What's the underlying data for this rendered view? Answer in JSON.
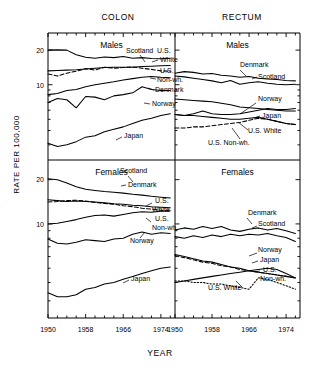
{
  "figure": {
    "column_titles": [
      "COLON",
      "RECTUM"
    ],
    "y_axis_label": "RATE PER 100,000",
    "x_axis_label": "YEAR",
    "panel_titles": [
      "Males",
      "Females"
    ]
  },
  "chart_data": {
    "type": "line",
    "xlabel": "YEAR",
    "ylabel": "RATE PER 100,000",
    "yscale": "log",
    "ylim": [
      2.6,
      24
    ],
    "xlim": [
      1950,
      1977
    ],
    "xticks": [
      1950,
      1958,
      1966,
      1974
    ],
    "xticklabels": [
      "1950",
      "1958",
      "1966",
      "1974"
    ],
    "yticks": [
      10,
      20
    ],
    "yticklabels": [
      "10",
      "20"
    ],
    "grid": false,
    "legend": "inline-annotations",
    "x": [
      1950,
      1952,
      1954,
      1956,
      1958,
      1960,
      1962,
      1964,
      1966,
      1968,
      1970,
      1972,
      1974,
      1976
    ],
    "panels": [
      {
        "panel": "COLON Males",
        "column": "COLON",
        "row": "Males",
        "series": [
          {
            "name": "Scotland",
            "style": "solid",
            "values": [
              20.0,
              20.1,
              20.0,
              18.2,
              17.3,
              17.0,
              17.4,
              17.2,
              17.6,
              17.0,
              17.2,
              16.9,
              16.8,
              17.0
            ]
          },
          {
            "name": "U.S. White",
            "style": "solid",
            "values": [
              13.2,
              13.3,
              13.4,
              13.5,
              13.7,
              13.9,
              14.1,
              14.2,
              14.2,
              14.2,
              14.4,
              14.5,
              14.6,
              14.7
            ]
          },
          {
            "name": "U.S. Non-wh.",
            "style": "dashed",
            "values": [
              12.4,
              11.9,
              12.6,
              13.1,
              13.8,
              13.4,
              14.2,
              13.9,
              14.1,
              14.3,
              13.9,
              13.6,
              13.2,
              13.1
            ]
          },
          {
            "name": "Denmark",
            "style": "solid",
            "values": [
              8.2,
              8.4,
              8.9,
              9.1,
              9.6,
              10.0,
              10.3,
              10.6,
              11.0,
              11.3,
              11.6,
              11.8,
              11.6,
              11.5
            ]
          },
          {
            "name": "Norway",
            "style": "solid",
            "values": [
              7.0,
              7.6,
              7.4,
              6.3,
              7.9,
              7.8,
              7.4,
              8.0,
              8.2,
              8.5,
              9.6,
              9.1,
              8.9,
              8.9
            ]
          },
          {
            "name": "Japan",
            "style": "solid",
            "values": [
              3.1,
              2.9,
              3.0,
              3.2,
              3.5,
              3.6,
              3.9,
              4.1,
              4.3,
              4.6,
              4.9,
              5.1,
              5.4,
              5.6
            ]
          }
        ]
      },
      {
        "panel": "COLON Females",
        "column": "COLON",
        "row": "Females",
        "series": [
          {
            "name": "Scotland",
            "style": "solid",
            "values": [
              20.3,
              20.0,
              19.0,
              17.9,
              17.2,
              16.9,
              16.6,
              16.4,
              16.2,
              15.9,
              15.7,
              15.4,
              15.2,
              15.0
            ]
          },
          {
            "name": "Denmark",
            "style": "solid",
            "values": [
              14.6,
              14.4,
              14.2,
              14.3,
              14.2,
              14.1,
              13.9,
              13.7,
              13.6,
              13.4,
              13.3,
              13.1,
              13.0,
              12.9
            ]
          },
          {
            "name": "U.S. White",
            "style": "dashed",
            "values": [
              14.1,
              14.2,
              14.4,
              14.5,
              14.3,
              14.0,
              13.8,
              13.6,
              13.3,
              13.1,
              12.8,
              12.6,
              12.4,
              12.2
            ]
          },
          {
            "name": "U.S. Non-wh.",
            "style": "solid",
            "values": [
              10.0,
              10.1,
              10.4,
              10.7,
              11.1,
              11.4,
              11.5,
              11.3,
              11.6,
              11.9,
              12.1,
              12.0,
              12.2,
              12.3
            ]
          },
          {
            "name": "Norway",
            "style": "solid",
            "values": [
              7.9,
              7.4,
              7.3,
              7.5,
              7.8,
              7.7,
              7.6,
              7.9,
              8.0,
              8.5,
              8.8,
              8.5,
              8.7,
              8.6
            ]
          },
          {
            "name": "Japan",
            "style": "solid",
            "values": [
              3.4,
              3.2,
              3.2,
              3.3,
              3.6,
              3.7,
              3.9,
              4.0,
              4.2,
              4.4,
              4.6,
              4.8,
              5.0,
              5.1
            ]
          }
        ]
      },
      {
        "panel": "RECTUM Males",
        "column": "RECTUM",
        "row": "Males",
        "series": [
          {
            "name": "Denmark",
            "style": "solid",
            "values": [
              12.6,
              13.0,
              12.8,
              12.4,
              12.5,
              12.1,
              11.9,
              11.6,
              11.8,
              11.4,
              11.2,
              11.1,
              10.9,
              10.8
            ]
          },
          {
            "name": "Scotland",
            "style": "solid",
            "values": [
              11.9,
              11.7,
              11.4,
              11.1,
              10.8,
              10.4,
              10.9,
              10.1,
              10.4,
              10.6,
              10.3,
              10.1,
              10.0,
              10.1
            ]
          },
          {
            "name": "Norway",
            "style": "solid",
            "values": [
              7.5,
              7.4,
              7.3,
              7.2,
              7.1,
              6.9,
              6.7,
              6.4,
              6.3,
              6.2,
              6.1,
              6.0,
              5.9,
              5.9
            ]
          },
          {
            "name": "Japan",
            "style": "solid",
            "values": [
              5.5,
              5.4,
              5.6,
              5.9,
              5.6,
              5.5,
              5.5,
              5.6,
              5.8,
              6.0,
              6.2,
              6.1,
              6.1,
              6.2
            ]
          },
          {
            "name": "U.S. White",
            "style": "solid",
            "values": [
              5.5,
              5.4,
              5.4,
              5.3,
              5.2,
              5.1,
              5.0,
              5.0,
              5.1,
              5.2,
              5.0,
              4.8,
              4.6,
              4.5
            ]
          },
          {
            "name": "U.S. Non-wh.",
            "style": "dashed",
            "values": [
              4.2,
              4.2,
              4.3,
              4.3,
              4.4,
              4.5,
              4.6,
              4.7,
              4.9,
              5.1,
              5.0,
              4.8,
              4.6,
              4.5
            ]
          }
        ]
      },
      {
        "panel": "RECTUM Females",
        "column": "RECTUM",
        "row": "Females",
        "series": [
          {
            "name": "Denmark",
            "style": "solid",
            "values": [
              9.1,
              9.4,
              9.2,
              9.6,
              9.3,
              9.6,
              9.1,
              8.9,
              9.2,
              9.4,
              9.1,
              9.3,
              9.0,
              8.6
            ]
          },
          {
            "name": "Scotland",
            "style": "solid",
            "values": [
              8.2,
              8.0,
              8.3,
              8.1,
              8.4,
              8.2,
              8.5,
              8.3,
              8.5,
              8.4,
              8.6,
              8.3,
              8.1,
              7.6
            ]
          },
          {
            "name": "Norway",
            "style": "solid",
            "values": [
              6.2,
              6.0,
              5.8,
              5.6,
              5.5,
              5.3,
              5.1,
              5.0,
              4.8,
              4.7,
              4.6,
              4.5,
              4.4,
              4.3
            ]
          },
          {
            "name": "Japan",
            "style": "dashed",
            "values": [
              6.1,
              5.9,
              5.7,
              5.5,
              5.4,
              5.2,
              5.1,
              4.9,
              4.8,
              4.7,
              4.6,
              4.5,
              4.4,
              4.3
            ]
          },
          {
            "name": "U.S. Non-wh.",
            "style": "solid",
            "values": [
              4.0,
              4.1,
              4.2,
              4.3,
              4.4,
              4.5,
              4.6,
              4.7,
              4.8,
              4.9,
              5.0,
              4.9,
              4.6,
              4.3
            ]
          },
          {
            "name": "U.S. White",
            "style": "dotted",
            "values": [
              4.1,
              4.1,
              4.0,
              4.0,
              3.9,
              3.9,
              3.8,
              3.7,
              3.6,
              4.3,
              4.2,
              4.0,
              3.8,
              3.6
            ]
          }
        ]
      }
    ],
    "annotations": {
      "colon_males": [
        "Scotland",
        "U.S. White",
        "U.S. Non-wh.",
        "Denmark",
        "Norway",
        "Japan"
      ],
      "colon_females": [
        "Scotland",
        "Denmark",
        "U.S. White",
        "U.S. Non-wh.",
        "Norway",
        "Japan"
      ],
      "rectum_males": [
        "Denmark",
        "Scotland",
        "Norway",
        "Japan",
        "U.S. White",
        "U.S. Non-wh."
      ],
      "rectum_females": [
        "Denmark",
        "Scotland",
        "Norway",
        "Japan",
        "U.S. Non-wh.",
        "U.S. White"
      ]
    },
    "label_text": {
      "scotland": "Scotland",
      "denmark": "Denmark",
      "norway": "Norway",
      "japan": "Japan",
      "us": "U.S.",
      "us_white_1": "U.S.",
      "us_white_2": "White",
      "us_nonwh_2": "Non-wh.",
      "us_white_full": "U.S. White",
      "us_nonwh_full": "U.S. Non-wh."
    }
  }
}
